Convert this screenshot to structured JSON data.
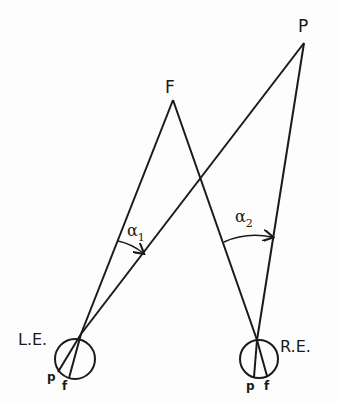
{
  "diagram": {
    "type": "binocular-vision-geometry",
    "points": {
      "F": {
        "label": "F",
        "x": 173,
        "y": 100
      },
      "P": {
        "label": "P",
        "x": 304,
        "y": 43
      }
    },
    "eyes": [
      {
        "label": "L.E.",
        "center": [
          75,
          359
        ],
        "radius": 20,
        "nodal": [
          81,
          334
        ],
        "retina_labels": {
          "p": "p",
          "f": "f"
        }
      },
      {
        "label": "R.E.",
        "center": [
          259,
          359
        ],
        "radius": 19,
        "nodal": [
          257,
          340
        ],
        "retina_labels": {
          "p": "p",
          "f": "f"
        }
      }
    ],
    "angles": [
      {
        "label": "α",
        "subscript": "1"
      },
      {
        "label": "α",
        "subscript": "2"
      }
    ],
    "stroke_color": "#1a1a1a"
  }
}
